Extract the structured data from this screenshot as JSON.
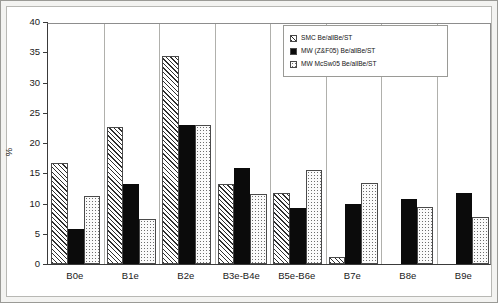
{
  "chart_data": {
    "type": "bar",
    "title": "",
    "xlabel": "",
    "ylabel": "%",
    "ylim": [
      0,
      40
    ],
    "yticks": [
      0,
      5,
      10,
      15,
      20,
      25,
      30,
      35,
      40
    ],
    "grid": false,
    "legend_position": "top-right",
    "categories": [
      "B0e",
      "B1e",
      "B2e",
      "B3e-B4e",
      "B5e-B6e",
      "B7e",
      "B8e",
      "B9e"
    ],
    "series": [
      {
        "name": "SMC Be/allBe/ST",
        "pattern": "diagonal-hatch",
        "values": [
          16.7,
          22.7,
          34.4,
          13.3,
          11.8,
          1.2,
          0,
          0
        ]
      },
      {
        "name": "MW (Z&F05) Be/allBe/ST",
        "pattern": "solid-black",
        "values": [
          5.8,
          13.3,
          23.0,
          15.8,
          9.3,
          9.9,
          10.8,
          11.7
        ]
      },
      {
        "name": "MW McSw05 Be/allBe/ST",
        "pattern": "light-dots",
        "values": [
          11.3,
          7.5,
          23.0,
          11.6,
          15.6,
          13.4,
          9.4,
          7.7
        ]
      }
    ]
  },
  "colors": {
    "axis": "#3a3a3a",
    "series_solid": "#0b0b0b",
    "plot_background": "#ffffff",
    "page_background": "#f3f3f1"
  }
}
